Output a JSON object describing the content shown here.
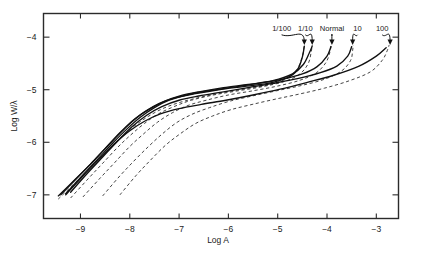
{
  "figure": {
    "background_color": "#ffffff",
    "frame_color": "#2b2b2b",
    "curve_color": "#111111"
  },
  "chart_data": {
    "type": "line",
    "title": "",
    "xlabel": "Log A",
    "ylabel": "Log W/λ",
    "xlim": [
      -9.75,
      -2.55
    ],
    "ylim": [
      -7.45,
      -3.55
    ],
    "xticks": [
      -9,
      -8,
      -7,
      -6,
      -5,
      -4,
      -3
    ],
    "xtick_labels": [
      "−9",
      "−8",
      "−7",
      "−6",
      "−5",
      "−4",
      "−3"
    ],
    "yticks": [
      -4,
      -5,
      -6,
      -7
    ],
    "ytick_labels": [
      "−4",
      "−5",
      "−6",
      "−7"
    ],
    "grid": false,
    "legend": "arrow annotations at curve endpoints",
    "annotations": [
      {
        "label": "1/100",
        "label_x": -4.92,
        "label_y": -3.88,
        "tip_x": -4.46,
        "tip_y": -4.15
      },
      {
        "label": "1/10",
        "label_x": -4.44,
        "label_y": -3.88,
        "tip_x": -4.3,
        "tip_y": -4.15
      },
      {
        "label": "Normal",
        "label_x": -3.9,
        "label_y": -3.88,
        "tip_x": -3.9,
        "tip_y": -4.15
      },
      {
        "label": "10",
        "label_x": -3.38,
        "label_y": -3.88,
        "tip_x": -3.48,
        "tip_y": -4.15
      },
      {
        "label": "100",
        "label_x": -2.88,
        "label_y": -3.88,
        "tip_x": -2.72,
        "tip_y": -4.15
      }
    ],
    "series": [
      {
        "name": "1/100 solid",
        "style": "solid",
        "points": [
          [
            -9.45,
            -7.02
          ],
          [
            -9.1,
            -6.7
          ],
          [
            -8.8,
            -6.42
          ],
          [
            -8.5,
            -6.12
          ],
          [
            -8.2,
            -5.82
          ],
          [
            -7.95,
            -5.6
          ],
          [
            -7.7,
            -5.42
          ],
          [
            -7.4,
            -5.26
          ],
          [
            -7.1,
            -5.16
          ],
          [
            -6.7,
            -5.08
          ],
          [
            -6.2,
            -5.0
          ],
          [
            -5.7,
            -4.94
          ],
          [
            -5.2,
            -4.88
          ],
          [
            -4.8,
            -4.77
          ],
          [
            -4.6,
            -4.62
          ],
          [
            -4.5,
            -4.38
          ],
          [
            -4.46,
            -4.17
          ]
        ]
      },
      {
        "name": "1/10 solid",
        "style": "solid",
        "points": [
          [
            -9.4,
            -7.0
          ],
          [
            -9.05,
            -6.66
          ],
          [
            -8.75,
            -6.37
          ],
          [
            -8.45,
            -6.07
          ],
          [
            -8.15,
            -5.78
          ],
          [
            -7.9,
            -5.56
          ],
          [
            -7.62,
            -5.38
          ],
          [
            -7.3,
            -5.22
          ],
          [
            -7.0,
            -5.12
          ],
          [
            -6.6,
            -5.04
          ],
          [
            -6.1,
            -4.96
          ],
          [
            -5.6,
            -4.9
          ],
          [
            -5.1,
            -4.83
          ],
          [
            -4.7,
            -4.7
          ],
          [
            -4.48,
            -4.52
          ],
          [
            -4.36,
            -4.3
          ],
          [
            -4.3,
            -4.17
          ]
        ]
      },
      {
        "name": "Normal solid",
        "style": "solid",
        "points": [
          [
            -9.3,
            -6.98
          ],
          [
            -8.95,
            -6.62
          ],
          [
            -8.65,
            -6.32
          ],
          [
            -8.35,
            -6.02
          ],
          [
            -8.05,
            -5.74
          ],
          [
            -7.78,
            -5.52
          ],
          [
            -7.5,
            -5.34
          ],
          [
            -7.2,
            -5.2
          ],
          [
            -6.85,
            -5.1
          ],
          [
            -6.4,
            -5.02
          ],
          [
            -5.9,
            -4.95
          ],
          [
            -5.4,
            -4.88
          ],
          [
            -4.9,
            -4.8
          ],
          [
            -4.5,
            -4.7
          ],
          [
            -4.2,
            -4.56
          ],
          [
            -4.0,
            -4.36
          ],
          [
            -3.92,
            -4.18
          ]
        ]
      },
      {
        "name": "10 solid",
        "style": "solid",
        "points": [
          [
            -9.2,
            -6.95
          ],
          [
            -8.85,
            -6.58
          ],
          [
            -8.55,
            -6.28
          ],
          [
            -8.25,
            -5.98
          ],
          [
            -7.95,
            -5.7
          ],
          [
            -7.65,
            -5.48
          ],
          [
            -7.35,
            -5.32
          ],
          [
            -7.0,
            -5.2
          ],
          [
            -6.6,
            -5.12
          ],
          [
            -6.1,
            -5.04
          ],
          [
            -5.6,
            -4.96
          ],
          [
            -5.1,
            -4.88
          ],
          [
            -4.6,
            -4.79
          ],
          [
            -4.15,
            -4.68
          ],
          [
            -3.8,
            -4.55
          ],
          [
            -3.58,
            -4.36
          ],
          [
            -3.5,
            -4.18
          ]
        ]
      },
      {
        "name": "100 solid",
        "style": "solid",
        "points": [
          [
            -9.3,
            -7.0
          ],
          [
            -8.95,
            -6.64
          ],
          [
            -8.62,
            -6.32
          ],
          [
            -8.3,
            -6.02
          ],
          [
            -8.0,
            -5.78
          ],
          [
            -7.7,
            -5.6
          ],
          [
            -7.38,
            -5.46
          ],
          [
            -7.0,
            -5.36
          ],
          [
            -6.55,
            -5.28
          ],
          [
            -6.05,
            -5.2
          ],
          [
            -5.5,
            -5.1
          ],
          [
            -4.95,
            -4.99
          ],
          [
            -4.4,
            -4.86
          ],
          [
            -3.85,
            -4.72
          ],
          [
            -3.35,
            -4.55
          ],
          [
            -3.0,
            -4.36
          ],
          [
            -2.8,
            -4.2
          ]
        ]
      },
      {
        "name": "1/100 dashed",
        "style": "dashed",
        "points": [
          [
            -9.45,
            -7.08
          ],
          [
            -9.1,
            -6.76
          ],
          [
            -8.8,
            -6.48
          ],
          [
            -8.5,
            -6.2
          ],
          [
            -8.22,
            -5.94
          ],
          [
            -7.95,
            -5.72
          ],
          [
            -7.68,
            -5.54
          ],
          [
            -7.38,
            -5.38
          ],
          [
            -7.05,
            -5.26
          ],
          [
            -6.65,
            -5.16
          ],
          [
            -6.15,
            -5.06
          ],
          [
            -5.65,
            -4.98
          ],
          [
            -5.15,
            -4.9
          ],
          [
            -4.8,
            -4.78
          ],
          [
            -4.6,
            -4.6
          ],
          [
            -4.5,
            -4.36
          ],
          [
            -4.46,
            -4.15
          ]
        ]
      },
      {
        "name": "1/10 dashed",
        "style": "dashed",
        "points": [
          [
            -9.2,
            -7.06
          ],
          [
            -8.85,
            -6.7
          ],
          [
            -8.55,
            -6.4
          ],
          [
            -8.25,
            -6.1
          ],
          [
            -7.98,
            -5.86
          ],
          [
            -7.7,
            -5.64
          ],
          [
            -7.42,
            -5.46
          ],
          [
            -7.1,
            -5.32
          ],
          [
            -6.75,
            -5.2
          ],
          [
            -6.3,
            -5.1
          ],
          [
            -5.8,
            -5.02
          ],
          [
            -5.3,
            -4.94
          ],
          [
            -4.85,
            -4.84
          ],
          [
            -4.55,
            -4.7
          ],
          [
            -4.38,
            -4.5
          ],
          [
            -4.32,
            -4.28
          ],
          [
            -4.3,
            -4.15
          ]
        ]
      },
      {
        "name": "Normal dashed",
        "style": "dashed",
        "points": [
          [
            -8.95,
            -7.04
          ],
          [
            -8.6,
            -6.68
          ],
          [
            -8.3,
            -6.38
          ],
          [
            -8.0,
            -6.08
          ],
          [
            -7.72,
            -5.84
          ],
          [
            -7.44,
            -5.62
          ],
          [
            -7.14,
            -5.44
          ],
          [
            -6.82,
            -5.3
          ],
          [
            -6.45,
            -5.2
          ],
          [
            -6.0,
            -5.1
          ],
          [
            -5.5,
            -5.02
          ],
          [
            -5.0,
            -4.93
          ],
          [
            -4.55,
            -4.82
          ],
          [
            -4.22,
            -4.68
          ],
          [
            -4.02,
            -4.48
          ],
          [
            -3.94,
            -4.28
          ],
          [
            -3.92,
            -4.15
          ]
        ]
      },
      {
        "name": "10 dashed",
        "style": "dashed",
        "points": [
          [
            -8.55,
            -7.02
          ],
          [
            -8.22,
            -6.66
          ],
          [
            -7.92,
            -6.36
          ],
          [
            -7.62,
            -6.08
          ],
          [
            -7.34,
            -5.84
          ],
          [
            -7.04,
            -5.62
          ],
          [
            -6.72,
            -5.46
          ],
          [
            -6.38,
            -5.34
          ],
          [
            -5.98,
            -5.22
          ],
          [
            -5.52,
            -5.12
          ],
          [
            -5.02,
            -5.02
          ],
          [
            -4.52,
            -4.92
          ],
          [
            -4.05,
            -4.8
          ],
          [
            -3.7,
            -4.64
          ],
          [
            -3.52,
            -4.44
          ],
          [
            -3.48,
            -4.25
          ],
          [
            -3.47,
            -4.15
          ]
        ]
      },
      {
        "name": "100 dashed",
        "style": "dashed",
        "points": [
          [
            -8.2,
            -7.0
          ],
          [
            -7.88,
            -6.64
          ],
          [
            -7.58,
            -6.34
          ],
          [
            -7.28,
            -6.06
          ],
          [
            -6.98,
            -5.84
          ],
          [
            -6.66,
            -5.64
          ],
          [
            -6.32,
            -5.5
          ],
          [
            -5.95,
            -5.38
          ],
          [
            -5.52,
            -5.28
          ],
          [
            -5.05,
            -5.18
          ],
          [
            -4.55,
            -5.08
          ],
          [
            -4.05,
            -4.97
          ],
          [
            -3.55,
            -4.83
          ],
          [
            -3.12,
            -4.66
          ],
          [
            -2.88,
            -4.44
          ],
          [
            -2.78,
            -4.26
          ],
          [
            -2.74,
            -4.15
          ]
        ]
      }
    ]
  }
}
